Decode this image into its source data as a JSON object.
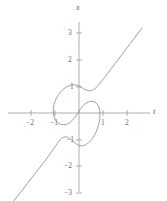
{
  "chart_data": {
    "type": "line",
    "title": "",
    "xlabel": "t",
    "ylabel": "x",
    "xlim": [
      -3.0,
      3.1
    ],
    "ylim": [
      -3.6,
      3.6
    ],
    "grid": false,
    "legend": null,
    "xticks": [
      -2,
      -1,
      1,
      2
    ],
    "xtick_labels": [
      "−2",
      "−1",
      "1",
      "2"
    ],
    "yticks": [
      -3,
      -2,
      -1,
      1,
      2,
      3
    ],
    "ytick_labels": [
      "−3",
      "−2",
      "−1",
      "1",
      "2",
      "3"
    ],
    "series": [
      {
        "name": "curve",
        "color": "#8e8e8e",
        "description": "S-shaped double-loop curve through the origin with straight diagonal branches to upper-right and lower-left",
        "points": [
          [
            -2.72,
            -3.32
          ],
          [
            -2.4,
            -2.95
          ],
          [
            -2.1,
            -2.6
          ],
          [
            -1.8,
            -2.25
          ],
          [
            -1.5,
            -1.9
          ],
          [
            -1.25,
            -1.6
          ],
          [
            -1.05,
            -1.34
          ],
          [
            -0.9,
            -1.15
          ],
          [
            -0.78,
            -1.0
          ],
          [
            -0.66,
            -0.92
          ],
          [
            -0.54,
            -0.9
          ],
          [
            -0.42,
            -0.94
          ],
          [
            -0.3,
            -1.02
          ],
          [
            -0.18,
            -1.12
          ],
          [
            -0.06,
            -1.2
          ],
          [
            0.08,
            -1.24
          ],
          [
            0.24,
            -1.22
          ],
          [
            0.4,
            -1.12
          ],
          [
            0.56,
            -0.96
          ],
          [
            0.7,
            -0.74
          ],
          [
            0.8,
            -0.5
          ],
          [
            0.86,
            -0.24
          ],
          [
            0.87,
            0.0
          ],
          [
            0.84,
            0.2
          ],
          [
            0.74,
            0.36
          ],
          [
            0.58,
            0.44
          ],
          [
            0.4,
            0.42
          ],
          [
            0.22,
            0.32
          ],
          [
            0.06,
            0.16
          ],
          [
            -0.06,
            -0.02
          ],
          [
            -0.2,
            -0.2
          ],
          [
            -0.38,
            -0.36
          ],
          [
            -0.58,
            -0.44
          ],
          [
            -0.78,
            -0.42
          ],
          [
            -0.94,
            -0.32
          ],
          [
            -1.04,
            -0.14
          ],
          [
            -1.07,
            0.08
          ],
          [
            -1.04,
            0.32
          ],
          [
            -0.94,
            0.56
          ],
          [
            -0.8,
            0.76
          ],
          [
            -0.62,
            0.92
          ],
          [
            -0.44,
            1.02
          ],
          [
            -0.26,
            1.06
          ],
          [
            -0.1,
            1.05
          ],
          [
            0.04,
            1.0
          ],
          [
            0.18,
            0.92
          ],
          [
            0.32,
            0.86
          ],
          [
            0.46,
            0.84
          ],
          [
            0.6,
            0.88
          ],
          [
            0.76,
            1.0
          ],
          [
            0.96,
            1.22
          ],
          [
            1.2,
            1.5
          ],
          [
            1.5,
            1.86
          ],
          [
            1.8,
            2.22
          ],
          [
            2.1,
            2.58
          ],
          [
            2.4,
            2.94
          ],
          [
            2.62,
            3.2
          ]
        ]
      }
    ]
  },
  "axes": {
    "horizontal_label": "t",
    "vertical_label": "x"
  }
}
